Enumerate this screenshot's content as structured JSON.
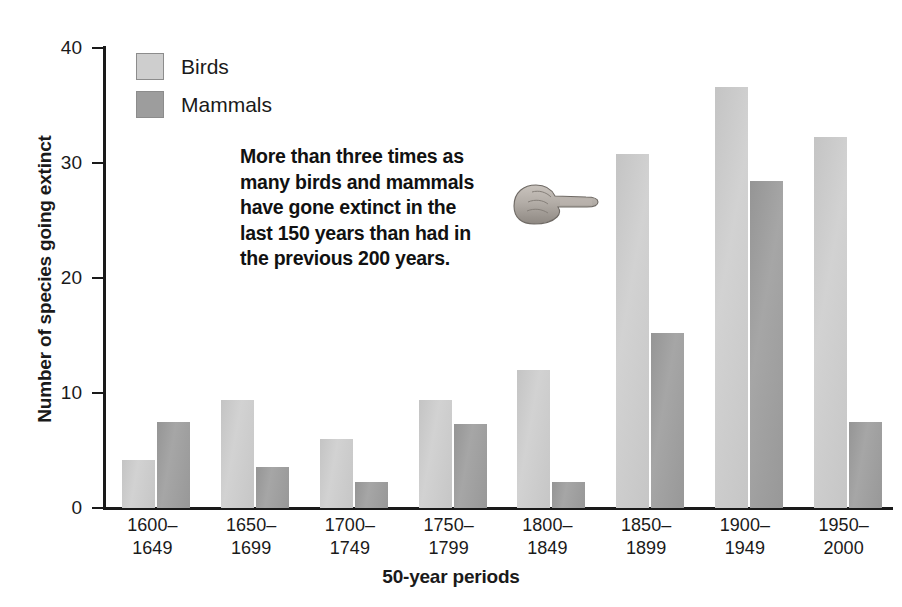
{
  "chart_data": {
    "type": "bar",
    "title": "",
    "xlabel": "50-year periods",
    "ylabel": "Number of species going extinct",
    "categories": [
      "1600–1649",
      "1650–1699",
      "1700–1749",
      "1750–1799",
      "1800–1849",
      "1850–1899",
      "1900–1949",
      "1950–2000"
    ],
    "category_lines": [
      [
        "1600–",
        "1649"
      ],
      [
        "1650–",
        "1699"
      ],
      [
        "1700–",
        "1749"
      ],
      [
        "1750–",
        "1799"
      ],
      [
        "1800–",
        "1849"
      ],
      [
        "1850–",
        "1899"
      ],
      [
        "1900–",
        "1949"
      ],
      [
        "1950–",
        "2000"
      ]
    ],
    "series": [
      {
        "name": "Birds",
        "color": "#cecece",
        "values": [
          4.2,
          9.4,
          6.0,
          9.4,
          12.0,
          30.8,
          36.6,
          32.3
        ]
      },
      {
        "name": "Mammals",
        "color": "#9d9d9d",
        "values": [
          7.5,
          3.6,
          2.3,
          7.3,
          2.3,
          15.2,
          28.4,
          7.5
        ]
      }
    ],
    "ylim": [
      0,
      40
    ],
    "yticks": [
      0,
      10,
      20,
      30,
      40
    ],
    "ytick_labels": [
      "0",
      "10",
      "20",
      "30",
      "40"
    ],
    "grid": false,
    "legend_position": "top-left"
  },
  "legend": {
    "items": [
      {
        "label": "Birds",
        "color": "#cecece"
      },
      {
        "label": "Mammals",
        "color": "#9d9d9d"
      }
    ]
  },
  "annotation": {
    "text": "More than three times as many birds and mammals have gone extinct in the last 150 years than had in the previous 200 years.",
    "lines": [
      "More than three times as",
      "many birds and mammals",
      "have gone extinct in the",
      "last 150 years than had in",
      "the previous 200 years."
    ],
    "pointer_icon": "pointing-hand-icon",
    "pointer_direction": "right"
  }
}
